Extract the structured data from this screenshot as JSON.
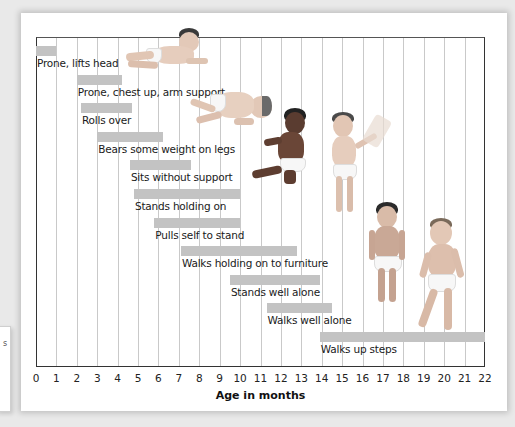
{
  "chart_data": {
    "type": "bar",
    "subtype": "horizontal-range (gantt-style)",
    "title": "",
    "xlabel": "Age in months",
    "ylabel": "",
    "xlim": [
      0,
      22
    ],
    "x_ticks": [
      "0",
      "1",
      "2",
      "3",
      "4",
      "5",
      "6",
      "7",
      "8",
      "9",
      "10",
      "11",
      "12",
      "13",
      "14",
      "15",
      "16",
      "17",
      "18",
      "19",
      "20",
      "21",
      "22"
    ],
    "grid": "vertical lines at each month",
    "legend": "none",
    "bar_color": "#c3c3c3",
    "milestones": [
      {
        "label": "Prone, lifts head",
        "start": 0.0,
        "end": 1.0
      },
      {
        "label": "Prone, chest up, arm support",
        "start": 2.0,
        "end": 4.2
      },
      {
        "label": "Rolls over",
        "start": 2.2,
        "end": 4.7
      },
      {
        "label": "Bears some weight on legs",
        "start": 3.0,
        "end": 6.2
      },
      {
        "label": "Sits without support",
        "start": 4.6,
        "end": 7.6
      },
      {
        "label": "Stands holding on",
        "start": 4.8,
        "end": 10.0
      },
      {
        "label": "Pulls self to stand",
        "start": 5.8,
        "end": 10.0
      },
      {
        "label": "Walks holding on to furniture",
        "start": 7.1,
        "end": 12.8
      },
      {
        "label": "Stands well alone",
        "start": 9.5,
        "end": 13.9
      },
      {
        "label": "Walks well alone",
        "start": 11.3,
        "end": 14.5
      },
      {
        "label": "Walks up steps",
        "start": 13.9,
        "end": 22.0
      }
    ],
    "illustrations": [
      "baby-prone-lifting-head",
      "baby-rolling-over",
      "baby-sitting",
      "baby-standing-holding-on",
      "toddler-standing-alone",
      "toddler-walking"
    ]
  },
  "side_panel": {
    "glyph": "s"
  }
}
